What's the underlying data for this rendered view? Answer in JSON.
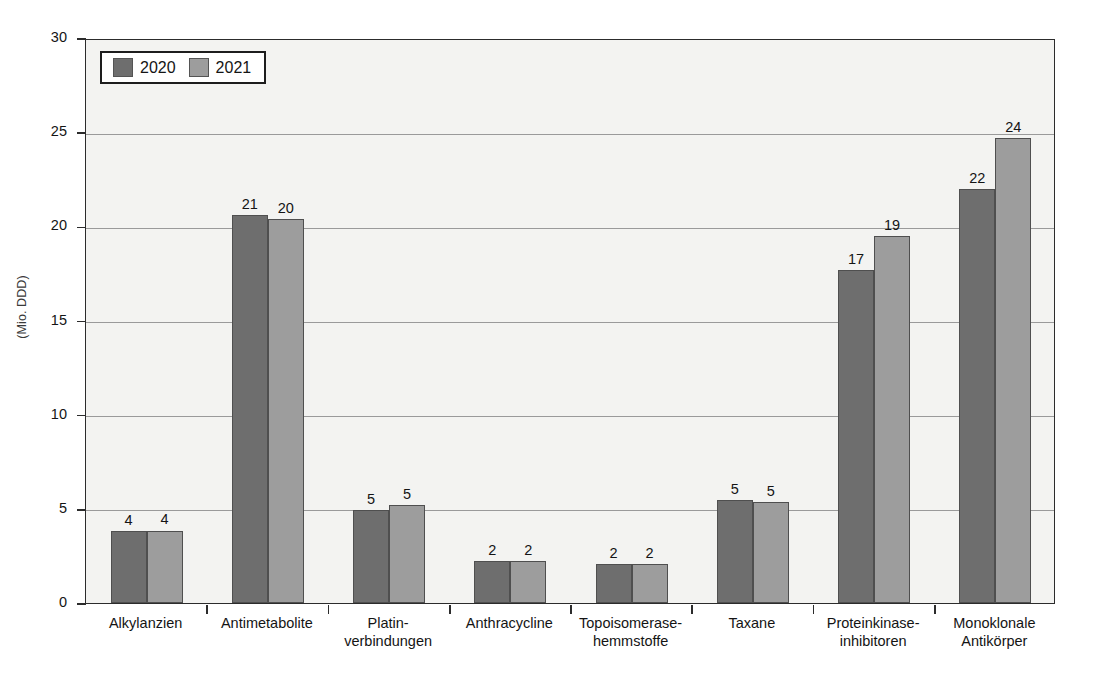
{
  "chart_data": {
    "type": "bar",
    "title": "",
    "subtitle": "",
    "xlabel": "",
    "ylabel": "(Mio. DDD)",
    "ylim": [
      0,
      30
    ],
    "ytick_labels": [
      "0",
      "5",
      "10",
      "15",
      "20",
      "25",
      "30"
    ],
    "yticks": [
      0,
      5,
      10,
      15,
      20,
      25,
      30
    ],
    "grid": true,
    "legend_position": "top-left",
    "categories": [
      "Alkylanzien",
      "Antimetabolite",
      "Platin-\nverbindungen",
      "Anthracycline",
      "Topoisomerase-\nhemmstoffe",
      "Taxane",
      "Proteinkinase-\ninhibitoren",
      "Monoklonale\nAntikörper"
    ],
    "category_lines": [
      [
        "Alkylanzien",
        ""
      ],
      [
        "Antimetabolite",
        ""
      ],
      [
        "Platin-",
        "verbindungen"
      ],
      [
        "Anthracycline",
        ""
      ],
      [
        "Topoisomerase-",
        "hemmstoffe"
      ],
      [
        "Taxane",
        ""
      ],
      [
        "Proteinkinase-",
        "inhibitoren"
      ],
      [
        "Monoklonale",
        "Antikörper"
      ]
    ],
    "series": [
      {
        "name": "2020",
        "color": "#6e6e6e",
        "values": [
          3.8,
          20.6,
          4.95,
          2.25,
          2.05,
          5.45,
          17.7,
          22.0
        ],
        "labels": [
          "4",
          "21",
          "5",
          "2",
          "2",
          "5",
          "17",
          "22"
        ]
      },
      {
        "name": "2021",
        "color": "#9d9d9d",
        "values": [
          3.85,
          20.4,
          5.2,
          2.25,
          2.05,
          5.35,
          19.5,
          24.7
        ],
        "labels": [
          "4",
          "20",
          "5",
          "2",
          "2",
          "5",
          "19",
          "24"
        ]
      }
    ],
    "colors": {
      "series_2020": "#6e6e6e",
      "series_2021": "#9d9d9d",
      "plot_background": "#f3f3f1",
      "axis": "#2c2c2c",
      "gridline": "#9a9a9a",
      "text": "#141414"
    }
  },
  "legend": {
    "entries": [
      {
        "label": "2020",
        "color": "#6e6e6e"
      },
      {
        "label": "2021",
        "color": "#9d9d9d"
      }
    ]
  }
}
